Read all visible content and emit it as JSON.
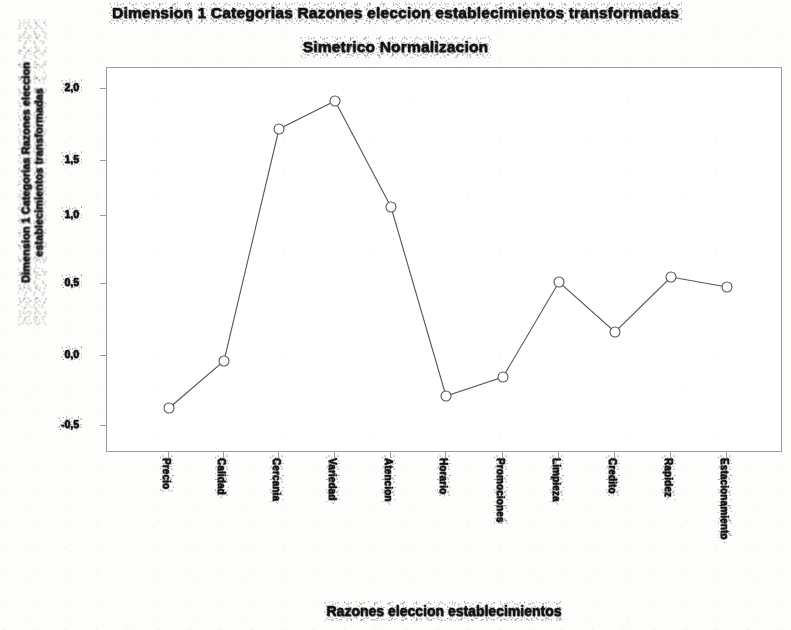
{
  "chart_data": {
    "type": "line",
    "title": "Dimension 1 Categorias Razones eleccion establecimientos transformadas",
    "subtitle": "Simetrico Normalizacion",
    "xlabel": "Razones eleccion establecimientos",
    "ylabel": "Dimension 1 Categorias Razones eleccion establecimientos transformadas",
    "grid": false,
    "legend": "none",
    "marker": "open-circle",
    "line_color": "#555555",
    "marker_color": "#555555",
    "categories": [
      "Precio",
      "Calidad",
      "Cercania",
      "Variedad",
      "Atencion",
      "Horario",
      "Promociones",
      "Limpieza",
      "Credito",
      "Rapidez",
      "Estacionamiento"
    ],
    "values": [
      -1.5,
      -1.0,
      1.2,
      1.4,
      0.55,
      -1.65,
      -1.5,
      -0.7,
      -1.05,
      -0.72,
      -0.78
    ],
    "ylim": [
      -2.0,
      2.0
    ],
    "yticks": [
      "2,0",
      "1,5",
      "1,0",
      "0,5",
      "0,0",
      "-0,5"
    ],
    "ytick_positions": [
      88,
      160,
      215,
      283,
      355,
      425
    ],
    "point_pixels": [
      {
        "x": 168,
        "y": 407
      },
      {
        "x": 223,
        "y": 360
      },
      {
        "x": 278,
        "y": 128
      },
      {
        "x": 334,
        "y": 100
      },
      {
        "x": 390,
        "y": 206
      },
      {
        "x": 445,
        "y": 395
      },
      {
        "x": 502,
        "y": 376
      },
      {
        "x": 558,
        "y": 281
      },
      {
        "x": 614,
        "y": 331
      },
      {
        "x": 670,
        "y": 276
      },
      {
        "x": 726,
        "y": 286
      }
    ]
  },
  "chart": {
    "title_line1": "Dimension 1 Categorias Razones eleccion establecimientos transformadas",
    "title_line2": "Simetrico Normalizacion",
    "y_axis_title": "Dimension 1 Categorias Razones eleccion establecimientos transformadas",
    "x_axis_title": "Razones eleccion establecimientos"
  }
}
